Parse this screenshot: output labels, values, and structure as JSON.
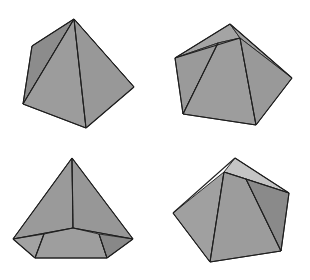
{
  "title": "Four views of pyramids",
  "colors": {
    "background": "#ffffff",
    "face_main": "#9a9a9a",
    "face_dark": "#858585",
    "face_light": "#c8c8c8",
    "face_mid": "#a6a6a6",
    "edge": "#1e1e1e"
  },
  "figures": [
    {
      "id": "square-pyramid-view-1",
      "label": "Square pyramid, oblique view",
      "faces": [
        {
          "name": "left-face",
          "points": "74,19 32,46 23,104",
          "fill": "#8c8c8c"
        },
        {
          "name": "back-right-face",
          "points": "74,19 134,87 96,60",
          "fill": "#d4d4d4"
        },
        {
          "name": "front-left-face",
          "points": "74,19 23,104 86,128",
          "fill": "#9c9c9c"
        },
        {
          "name": "front-right-face",
          "points": "74,19 86,128 134,87",
          "fill": "#989898"
        }
      ],
      "edges": [
        [
          74,
          19,
          32,
          46
        ],
        [
          32,
          46,
          23,
          104
        ],
        [
          23,
          104,
          86,
          128
        ],
        [
          86,
          128,
          134,
          87
        ],
        [
          134,
          87,
          74,
          19
        ],
        [
          74,
          19,
          23,
          104
        ],
        [
          74,
          19,
          86,
          128
        ]
      ]
    },
    {
      "id": "pentagonal-pyramid-view-2",
      "label": "Pentagonal pyramid, apex toward viewer",
      "faces": [
        {
          "name": "top-face",
          "points": "230,24 175,58 218,43 240,38",
          "fill": "#a4a4a4"
        },
        {
          "name": "top-right-face",
          "points": "230,24 240,38 292,78",
          "fill": "#a0a0a0"
        },
        {
          "name": "left-face",
          "points": "175,58 183,114 218,43",
          "fill": "#9a9a9a"
        },
        {
          "name": "center-face",
          "points": "218,43 183,114 256,125 240,38",
          "fill": "#9d9d9d"
        },
        {
          "name": "right-face",
          "points": "240,38 256,125 292,78",
          "fill": "#999999"
        }
      ],
      "edges": [
        [
          230,
          24,
          175,
          58
        ],
        [
          175,
          58,
          183,
          114
        ],
        [
          183,
          114,
          256,
          125
        ],
        [
          256,
          125,
          292,
          78
        ],
        [
          292,
          78,
          230,
          24
        ],
        [
          175,
          58,
          240,
          38
        ],
        [
          218,
          43,
          183,
          114
        ],
        [
          240,
          38,
          256,
          125
        ]
      ]
    },
    {
      "id": "pentagonal-pyramid-view-3",
      "label": "Pentagonal pyramid, front view with visible base",
      "faces": [
        {
          "name": "left-face",
          "points": "72,158 13,239 73,228",
          "fill": "#9a9a9a"
        },
        {
          "name": "right-face",
          "points": "72,158 73,228 133,239",
          "fill": "#979797"
        },
        {
          "name": "base-left",
          "points": "13,239 44,234 35,258",
          "fill": "#a2a2a2"
        },
        {
          "name": "base-center",
          "points": "44,234 73,228 99,234 107,258 35,258",
          "fill": "#9e9e9e"
        },
        {
          "name": "base-right",
          "points": "99,234 133,239 107,258",
          "fill": "#888888"
        }
      ],
      "edges": [
        [
          72,
          158,
          13,
          239
        ],
        [
          72,
          158,
          133,
          239
        ],
        [
          72,
          158,
          73,
          228
        ],
        [
          13,
          239,
          73,
          228
        ],
        [
          73,
          228,
          133,
          239
        ],
        [
          13,
          239,
          35,
          258
        ],
        [
          35,
          258,
          107,
          258
        ],
        [
          107,
          258,
          133,
          239
        ],
        [
          44,
          234,
          35,
          258
        ],
        [
          99,
          234,
          107,
          258
        ]
      ]
    },
    {
      "id": "pentagonal-pyramid-view-4",
      "label": "Pentagonal pyramid, rotated view",
      "faces": [
        {
          "name": "top-light-face",
          "points": "235,158 224,172 246,179 289,193",
          "fill": "#c4c4c4"
        },
        {
          "name": "left-face",
          "points": "224,172 173,213 210,262",
          "fill": "#a0a0a0"
        },
        {
          "name": "center-face",
          "points": "224,172 210,262 281,251 246,179",
          "fill": "#9c9c9c"
        },
        {
          "name": "right-face",
          "points": "246,179 281,251 289,193",
          "fill": "#8a8a8a"
        }
      ],
      "edges": [
        [
          235,
          158,
          173,
          213
        ],
        [
          173,
          213,
          210,
          262
        ],
        [
          210,
          262,
          281,
          251
        ],
        [
          281,
          251,
          289,
          193
        ],
        [
          289,
          193,
          235,
          158
        ],
        [
          224,
          172,
          289,
          193
        ],
        [
          224,
          172,
          210,
          262
        ],
        [
          246,
          179,
          281,
          251
        ]
      ]
    }
  ]
}
